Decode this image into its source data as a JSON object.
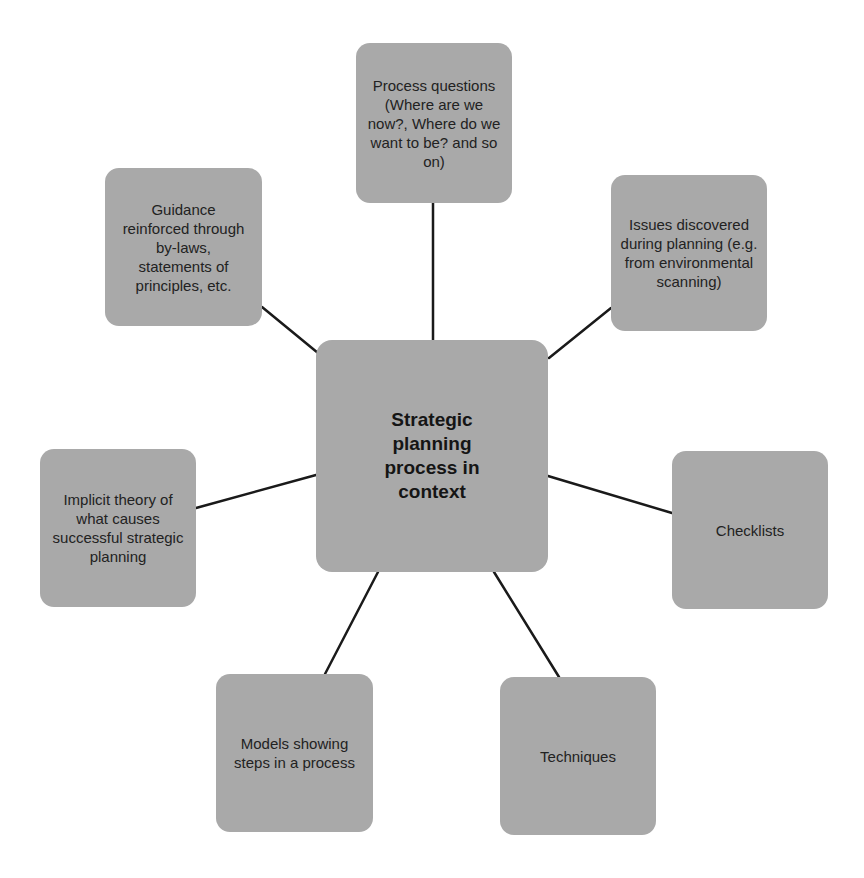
{
  "diagram": {
    "center": {
      "label": "Strategic planning process in context"
    },
    "nodes": [
      {
        "id": "process-questions",
        "label": "Process questions (Where are we now?, Where do we want to be? and so on)"
      },
      {
        "id": "issues",
        "label": "Issues discovered during planning (e.g. from environmental scanning)"
      },
      {
        "id": "checklists",
        "label": "Checklists"
      },
      {
        "id": "techniques",
        "label": "Techniques"
      },
      {
        "id": "models",
        "label": "Models showing steps in a process"
      },
      {
        "id": "implicit-theory",
        "label": "Implicit theory of what causes successful strategic planning"
      },
      {
        "id": "guidance",
        "label": "Guidance reinforced through by-laws, statements of principles, etc."
      }
    ],
    "colors": {
      "box": "#a9a9a9",
      "line": "#1a1a1a",
      "text": "#222222"
    }
  }
}
